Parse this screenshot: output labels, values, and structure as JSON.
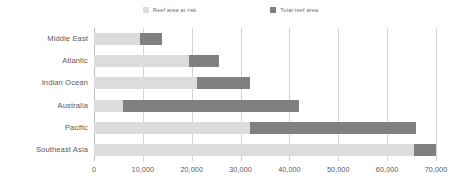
{
  "chart_data": {
    "type": "bar",
    "orientation": "horizontal",
    "overlap": true,
    "title": "",
    "subtitle": "",
    "xlabel": "",
    "ylabel": "",
    "xlim": [
      0,
      70000
    ],
    "xticks": [
      0,
      10000,
      20000,
      30000,
      40000,
      50000,
      60000,
      70000
    ],
    "xtick_labels": [
      "0",
      "10,000",
      "20,000",
      "30,000",
      "40,000",
      "50,000",
      "60,000",
      "70,000"
    ],
    "grid": true,
    "grid_axis": "x",
    "legend_position": "top-center",
    "categories": [
      "Middle East",
      "Atlantic",
      "Indian Ocean",
      "Australia",
      "Pacific",
      "Southeast Asia"
    ],
    "series": [
      {
        "name": "Reef area at risk",
        "color": "#dcdcdc",
        "values": [
          9500,
          19500,
          21000,
          6000,
          32000,
          65500
        ]
      },
      {
        "name": "Total reef area",
        "color": "#808080",
        "values": [
          14000,
          25500,
          32000,
          42000,
          66000,
          70000
        ]
      }
    ]
  },
  "legend": {
    "items": [
      {
        "label": "Reef area at risk",
        "color": "#dcdcdc"
      },
      {
        "label": "Total reef area",
        "color": "#808080"
      }
    ]
  },
  "colors": {
    "risk": "#dcdcdc",
    "total": "#808080",
    "gridline": "#d4d4d4",
    "axis": "#bdbdbd",
    "text": "#58595b",
    "background": "#ffffff"
  }
}
